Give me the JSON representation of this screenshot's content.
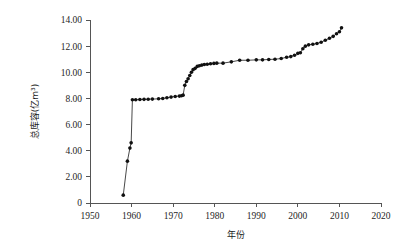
{
  "chart_data": {
    "type": "line",
    "title": "",
    "xlabel": "年份",
    "ylabel": "总库容(亿m³)",
    "xlim": [
      1950,
      2020
    ],
    "ylim": [
      0,
      14
    ],
    "xticks": [
      1950,
      1960,
      1970,
      1980,
      1990,
      2000,
      2010,
      2020
    ],
    "xtick_labels": [
      "1950",
      "1960",
      "1970",
      "1980",
      "1990",
      "2000",
      "2010",
      "2020"
    ],
    "yticks": [
      0,
      2,
      4,
      6,
      8,
      10,
      12,
      14
    ],
    "ytick_labels": [
      "0",
      "2.00",
      "4.00",
      "6.00",
      "8.00",
      "10.00",
      "12.00",
      "14.00"
    ],
    "grid": false,
    "legend": null,
    "marker": "filled-circle",
    "line_color": "#333333",
    "marker_color": "#111111",
    "series": [
      {
        "name": "总库容",
        "x": [
          1958,
          1959,
          1959.6,
          1959.9,
          1960.2,
          1961,
          1962,
          1963,
          1964,
          1965,
          1966.5,
          1967.5,
          1968.5,
          1969.5,
          1970.5,
          1971.5,
          1972,
          1972.4,
          1972.8,
          1973.2,
          1973.6,
          1974,
          1974.4,
          1974.8,
          1975.3,
          1975.8,
          1976.3,
          1976.9,
          1977.5,
          1978.2,
          1979,
          1979.8,
          1980.5,
          1982,
          1984,
          1986,
          1988,
          1990,
          1991.5,
          1993,
          1994.5,
          1996,
          1997.3,
          1998.3,
          1999.2,
          2000,
          2000.6,
          2001.2,
          2001.8,
          2002.6,
          2003.6,
          2004.6,
          2005.6,
          2006.6,
          2007.6,
          2008.5,
          2009.3,
          2010,
          2010.5
        ],
        "y": [
          0.6,
          3.2,
          4.2,
          4.6,
          7.9,
          7.9,
          7.92,
          7.93,
          7.94,
          7.95,
          7.97,
          8.0,
          8.05,
          8.1,
          8.15,
          8.18,
          8.2,
          8.25,
          9.0,
          9.3,
          9.5,
          9.75,
          10.0,
          10.2,
          10.3,
          10.45,
          10.5,
          10.55,
          10.6,
          10.62,
          10.65,
          10.68,
          10.7,
          10.7,
          10.8,
          10.92,
          10.92,
          10.95,
          10.95,
          10.98,
          11.0,
          11.05,
          11.15,
          11.2,
          11.3,
          11.45,
          11.5,
          11.8,
          12.0,
          12.1,
          12.15,
          12.2,
          12.3,
          12.45,
          12.6,
          12.75,
          12.95,
          13.1,
          13.4
        ]
      }
    ]
  },
  "axes_geometry": {
    "plot_left": 90,
    "plot_right": 381,
    "plot_top": 20,
    "plot_bottom": 203
  }
}
